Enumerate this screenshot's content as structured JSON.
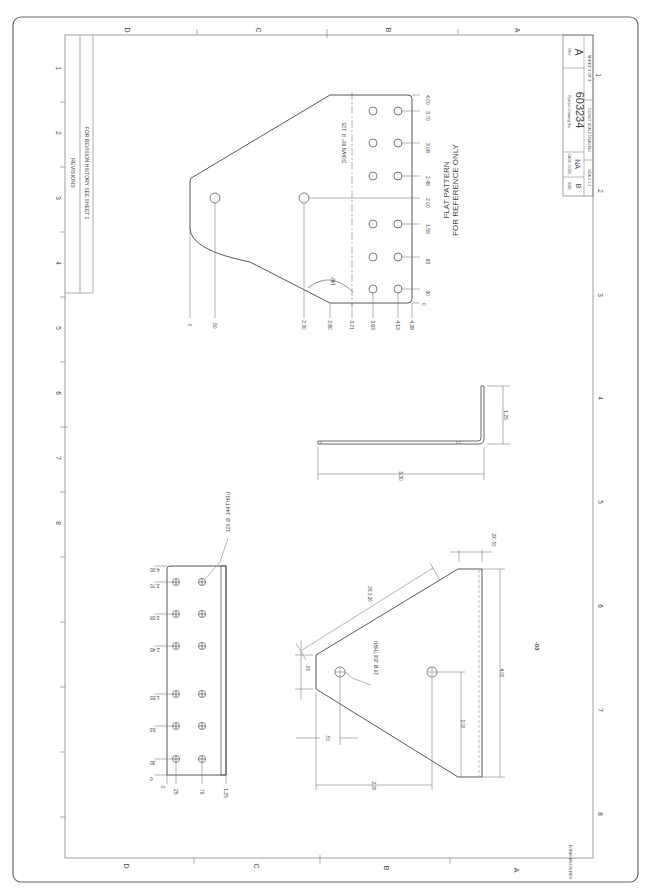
{
  "border": {
    "letters_top": [
      "D",
      "C",
      "B",
      "A"
    ],
    "letters_bottom": [
      "D",
      "C",
      "B",
      "A"
    ],
    "numbers_left": [
      "1",
      "2",
      "3",
      "4",
      "5",
      "6",
      "7",
      "8"
    ],
    "numbers_right": [
      "1",
      "2",
      "3",
      "4",
      "5",
      "6",
      "7",
      "8"
    ],
    "form_number": "FORM M6209 REV"
  },
  "revisions": {
    "title": "REVISIONS",
    "note": "FOR REVISION HISTORY SEE SHEET 1"
  },
  "title_block": {
    "size_label": "SIZE",
    "size": "B",
    "cage_label": "CAGE CODE",
    "cage": "NA",
    "dwg_label": "Ryerson Drawing No.",
    "dwg_no": "603234",
    "rev_label": "REV",
    "rev": "A",
    "scale": "SCALE 1:1",
    "no_scale": "DO NOT SCALE DRAWING",
    "sheet": "SHEET 3 OF 3"
  },
  "flat_pattern": {
    "label_line1": "FLAT PATTERN",
    "label_line2": "FOR REFERENCE ONLY",
    "bend_note": "DOWN 90° R .125",
    "angle": "149°",
    "ordinates_right": [
      "4.00",
      "3.70",
      "3.08",
      "2.45",
      "2.00",
      "1.55",
      ".93",
      ".30",
      "0"
    ],
    "ordinates_bottom": [
      "0",
      ".50",
      "2.30",
      "2.80",
      "3.21",
      "3.63",
      "4.13",
      "4.38"
    ]
  },
  "top_view": {
    "hole_callout": "12X Ø .144 THRU",
    "ordinates_left": [
      "4.00",
      "3.70",
      "3.08",
      "2.45",
      "1.55",
      ".93",
      ".30",
      "0"
    ],
    "ordinates_bottom": [
      "0",
      ".25",
      ".75",
      "1.25"
    ]
  },
  "side_view": {
    "dim_length": "3.30",
    "dim_flange": "1.25"
  },
  "front_view": {
    "dash_label": "-03",
    "hole_callout": "2X Ø .206 THRU",
    "dim_tip": ".65",
    "dim_slope": "2X 3.26",
    "dim_chamfer": "2X .50",
    "dim_hole_offset": ".50",
    "dim_hole_spacing": "2.00",
    "dim_depth": "2.30",
    "dim_width": "4.00"
  }
}
